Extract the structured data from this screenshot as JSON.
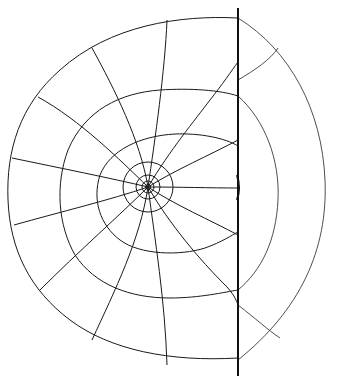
{
  "diagram": {
    "type": "polar field-line mesh with boundary wall",
    "source_center": {
      "x": 148,
      "y": 187
    },
    "wall": {
      "x": 238,
      "y_top": 8,
      "y_bottom": 376
    },
    "rings": [
      {
        "name": "ring-1",
        "r": 5
      },
      {
        "name": "ring-2",
        "r": 10
      },
      {
        "name": "ring-3",
        "r": 25
      },
      {
        "name": "ring-4",
        "r": 45
      }
    ],
    "stroke_color": "#1a1a1a",
    "background": "#ffffff"
  }
}
